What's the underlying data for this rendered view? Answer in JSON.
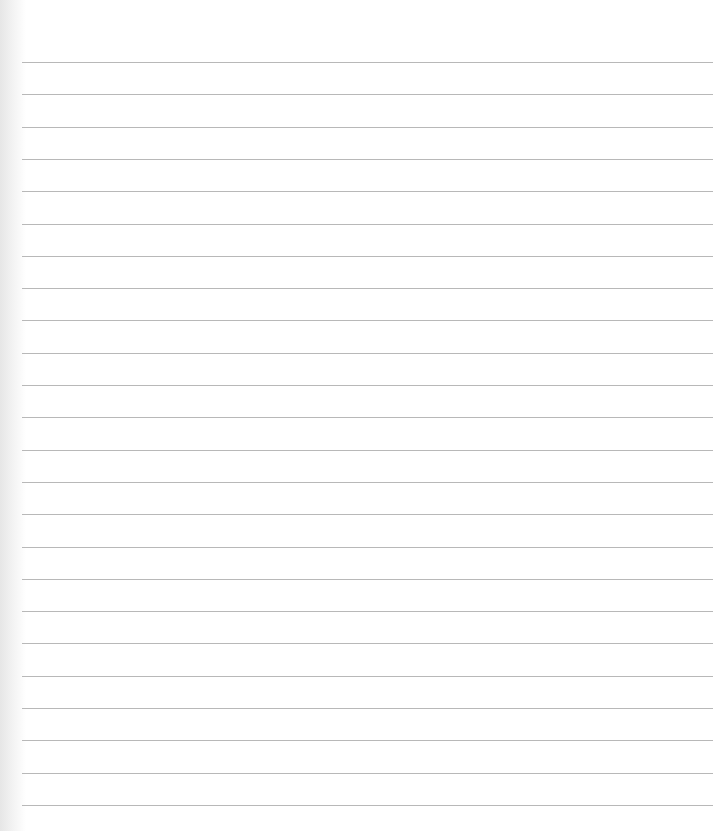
{
  "page": {
    "type": "lined-notebook-paper",
    "background_color": "#ffffff",
    "line_color": "#b8b8b8",
    "line_count": 24,
    "first_line_y": 62,
    "line_spacing": 32.3,
    "line_left": 22,
    "line_right": 713,
    "text": ""
  }
}
